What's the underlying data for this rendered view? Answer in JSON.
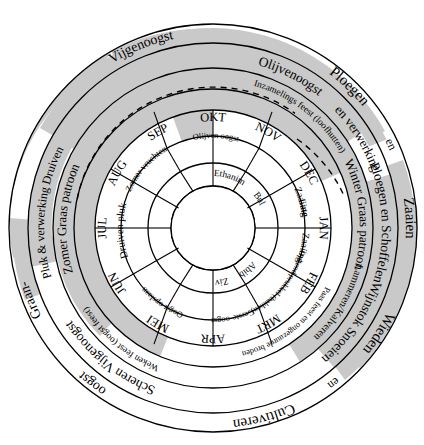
{
  "diagram": {
    "colors": {
      "ink": "#000000",
      "paper": "#ffffff",
      "shade": "#c9c9c9"
    }
  },
  "rings": {
    "outer_activities": {
      "name": "buitenste activiteiten ring",
      "labels": [
        "Ploegen",
        "en",
        "Zaaien",
        "Wieden",
        "en",
        "Cultiveren",
        "oogst",
        "Graan-",
        "Vijgenoogst"
      ]
    },
    "second_activities": {
      "name": "tweede activiteiten ring",
      "labels": [
        "Olijvenoogst",
        "en verwerking",
        "Ploegen en Schoffelen",
        "Wijnstok Snoeien",
        "Scheren",
        "Vijgenoogst",
        "Pluk & verwerking Druiven"
      ]
    },
    "graze_ring": {
      "name": "graas patroon ring",
      "labels": [
        "Winter Graas patroon",
        "Lammeren/Kalveren",
        "Weken feest (oogst feest)",
        "Zomer Graas patroon",
        "Inzamelings feest (loofhutten)"
      ]
    },
    "feast_ring": {
      "name": "feest ring",
      "labels": [
        "Paas feest en ongezuurde broden",
        "Weken feest (oogst feest)",
        "Inzamelings feest (loofhutten)"
      ]
    },
    "months_gregorian": {
      "name": "gregoriaanse maanden",
      "labels": [
        "JAN",
        "FEB",
        "MRT",
        "APR",
        "MEI",
        "JUN",
        "JUL",
        "AUG",
        "SEP",
        "OKT",
        "NOV",
        "DEC"
      ]
    },
    "tasks_ring": {
      "name": "taken ring",
      "labels": [
        "Late",
        "Zaaiing",
        "Opkend prukkel (bakken)",
        "Gerste-oogst",
        "Oogst opslaan",
        "Druiven pluk",
        "Zomer vruchten",
        "Olijven oogst",
        "Zaaiing"
      ]
    },
    "hebrew_months": {
      "name": "hebreeuwse maanden",
      "labels": [
        "Abib",
        "Ziv",
        "Ethanim",
        "Bul"
      ]
    }
  },
  "labels": {
    "zaaien": "Zaaien",
    "wieden": "Wieden",
    "en_top_left": "en",
    "en_top_right": "en",
    "ploegen": "Ploegen",
    "cultiveren": "Cultiveren",
    "graan_oogst_part1": "Graan-",
    "graan_oogst_part2": "oogst",
    "vijgenoogst_left": "Vijgenoogst",
    "vijgenoogst_right": "Vijgenoogst",
    "scheren": "Scheren",
    "olijvenoogst": "Olijvenoogst",
    "en_verwerking": "en  verwerking",
    "ploegen_en_schoffelen": "Ploegen en Schoffelen",
    "wijnstok_snoeien": "Wijnstok Snoeien",
    "winter_graas_patroon": "Winter Graas patroon",
    "zomer_graas_patroon": "Zomer Graas patroon",
    "lammeren_kalveren": "Lammeren/Kalveren",
    "pluk_verwerking_druiven": "Pluk & verwerking Druiven",
    "paas_feest": "Paas feest en ongezuurde broden",
    "weken_feest": "Weken feest (oogst feest)",
    "inzamelings_feest": "Inzamelings feest (loofhutten)",
    "late": "Late",
    "zaaiing_right": "Zaaiing",
    "zaaiing_left": "Zaaiing",
    "opkend_prukkel": "Opkend prukkel (bakken)",
    "gerste_oogst": "Gerste-oogst",
    "oogst_opslaan": "Oogst opslaan",
    "druiven_pluk": "Druiven pluk",
    "zomer_vruchten": "Zomer vruchten",
    "olijven_oogst": "Olijven oogst",
    "abib": "Abib",
    "ziv": "Ziv",
    "ethanim": "Ethanim",
    "bul": "Bul",
    "jan": "JAN",
    "feb": "FEB",
    "mrt": "MRT",
    "apr": "APR",
    "mei": "MEI",
    "jun": "JUN",
    "jul": "JUL",
    "aug": "AUG",
    "sep": "SEP",
    "okt": "OKT",
    "nov": "NOV",
    "dec": "DEC"
  }
}
